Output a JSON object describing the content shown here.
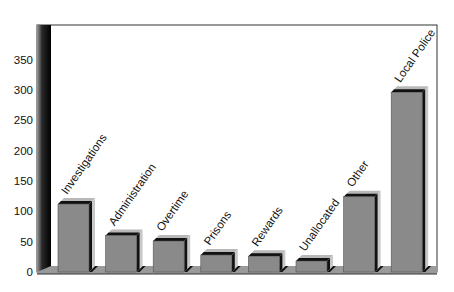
{
  "chart_data": {
    "type": "bar",
    "title": "",
    "xlabel": "",
    "ylabel": "",
    "ylim": [
      0,
      390
    ],
    "yticks": [
      0,
      50,
      100,
      150,
      200,
      250,
      300,
      350
    ],
    "grid": false,
    "legend": null,
    "style": "3d",
    "categories": [
      "Investigations",
      "Administration",
      "Overtime",
      "Prisons",
      "Rewards",
      "Unallocated",
      "Other",
      "Local Police"
    ],
    "values": [
      112,
      60,
      51,
      28,
      26,
      18,
      124,
      296
    ]
  },
  "colors": {
    "bar_front": "#8a8a8a",
    "bar_top": "#b8b8b8",
    "bar_side": "#c8c8c8",
    "bar_shadow": "#111111",
    "wall": "#1a1a1a",
    "frame": "#333333"
  }
}
